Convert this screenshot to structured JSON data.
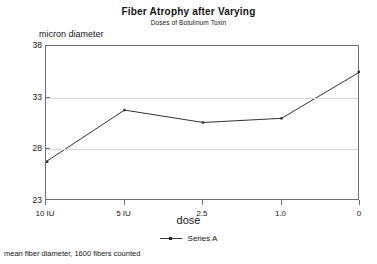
{
  "chart_data": {
    "type": "line",
    "title": "Fiber Atrophy after Varying",
    "subtitle": "Doses of Botulinum Toxin",
    "xlabel": "dose",
    "ylabel": "micron diameter",
    "footnote": "mean fiber diameter, 1600 fibers counted",
    "categories": [
      "10 IU",
      "5 IU",
      "2.5",
      "1.0",
      "0"
    ],
    "x_tick_labels": [
      "10 IU",
      "5 IU",
      "2.5",
      "1.0",
      "0"
    ],
    "y_tick_labels": [
      "23",
      "28",
      "33",
      "38"
    ],
    "y_ticks": [
      23,
      28,
      33,
      38
    ],
    "ylim": [
      23,
      38
    ],
    "grid": "horizontal",
    "legend_position": "bottom",
    "series": [
      {
        "name": "Series A",
        "values": [
          26.8,
          31.8,
          30.6,
          31.0,
          35.5
        ],
        "color": "#333333",
        "marker": "dot"
      }
    ]
  },
  "legend": {
    "entries": [
      {
        "label": "Series A"
      }
    ]
  }
}
